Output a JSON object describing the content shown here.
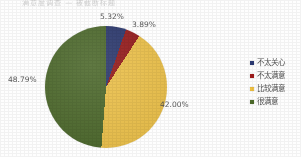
{
  "title": {
    "clipped_text": "满意度调查  —  被截断标题"
  },
  "colors": {
    "slice_navy": "#2c3a73",
    "slice_red": "#9e1b1b",
    "slice_gold": "#f0c244",
    "slice_green": "#4d6b2a",
    "background": "#ffffff",
    "label_text": "#4d4d4d"
  },
  "chart_data": {
    "type": "pie",
    "title": "",
    "categories": [
      "不太关心",
      "不太满意",
      "比较满意",
      "很满意"
    ],
    "values": [
      5.32,
      3.89,
      42.0,
      48.79
    ],
    "value_labels": [
      "5.32%",
      "3.89%",
      "42.00%",
      "48.79%"
    ],
    "colors": [
      "#2c3a73",
      "#9e1b1b",
      "#f0c244",
      "#4d6b2a"
    ],
    "start_angle_deg": 0,
    "direction": "clockwise",
    "legend_position": "right",
    "grid": false,
    "units": "percent"
  },
  "labels": {
    "navy": "5.32%",
    "red": "3.89%",
    "gold": "42.00%",
    "green": "48.79%"
  },
  "legend": {
    "items": [
      {
        "label": "不太关心",
        "color": "#2c3a73"
      },
      {
        "label": "不太满意",
        "color": "#9e1b1b"
      },
      {
        "label": "比较满意",
        "color": "#f0c244"
      },
      {
        "label": "很满意",
        "color": "#4d6b2a"
      }
    ]
  }
}
